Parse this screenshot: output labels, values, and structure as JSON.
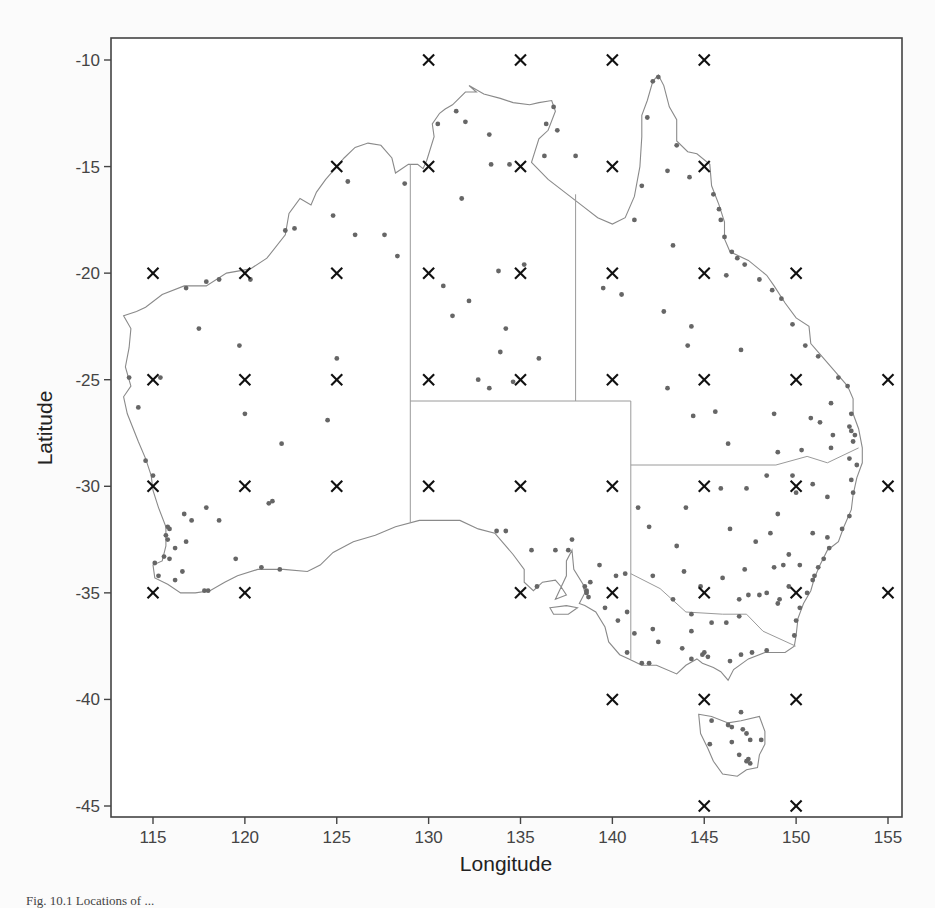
{
  "figure": {
    "caption": "Fig. 10.1 Locations of ..."
  },
  "chart_data": {
    "type": "scatter",
    "title": "",
    "xlabel": "Longitude",
    "ylabel": "Latitude",
    "xlim": [
      112.8,
      155.4
    ],
    "ylim": [
      -45.5,
      -9.0
    ],
    "xticks": [
      115,
      120,
      125,
      130,
      135,
      140,
      145,
      150,
      155
    ],
    "yticks": [
      -10,
      -15,
      -20,
      -25,
      -30,
      -35,
      -40,
      -45
    ],
    "grid": false,
    "legend": null,
    "series": [
      {
        "name": "Grid points",
        "marker": "x",
        "color": "#111111",
        "points": [
          [
            130,
            -10
          ],
          [
            135,
            -10
          ],
          [
            140,
            -10
          ],
          [
            145,
            -10
          ],
          [
            125,
            -15
          ],
          [
            130,
            -15
          ],
          [
            135,
            -15
          ],
          [
            140,
            -15
          ],
          [
            145,
            -15
          ],
          [
            115,
            -20
          ],
          [
            120,
            -20
          ],
          [
            125,
            -20
          ],
          [
            130,
            -20
          ],
          [
            135,
            -20
          ],
          [
            140,
            -20
          ],
          [
            145,
            -20
          ],
          [
            150,
            -20
          ],
          [
            115,
            -25
          ],
          [
            120,
            -25
          ],
          [
            125,
            -25
          ],
          [
            130,
            -25
          ],
          [
            135,
            -25
          ],
          [
            140,
            -25
          ],
          [
            145,
            -25
          ],
          [
            150,
            -25
          ],
          [
            155,
            -25
          ],
          [
            115,
            -30
          ],
          [
            120,
            -30
          ],
          [
            125,
            -30
          ],
          [
            130,
            -30
          ],
          [
            135,
            -30
          ],
          [
            140,
            -30
          ],
          [
            145,
            -30
          ],
          [
            150,
            -30
          ],
          [
            155,
            -30
          ],
          [
            115,
            -35
          ],
          [
            120,
            -35
          ],
          [
            135,
            -35
          ],
          [
            140,
            -35
          ],
          [
            145,
            -35
          ],
          [
            150,
            -35
          ],
          [
            155,
            -35
          ],
          [
            140,
            -40
          ],
          [
            145,
            -40
          ],
          [
            150,
            -40
          ],
          [
            145,
            -45
          ],
          [
            150,
            -45
          ]
        ]
      },
      {
        "name": "Stations",
        "marker": "dot",
        "color": "#666666",
        "points": [
          [
            132.0,
            -12.9
          ],
          [
            131.5,
            -12.4
          ],
          [
            133.3,
            -13.5
          ],
          [
            136.8,
            -12.2
          ],
          [
            136.4,
            -13.0
          ],
          [
            137.0,
            -13.3
          ],
          [
            141.9,
            -12.7
          ],
          [
            142.2,
            -11.0
          ],
          [
            142.5,
            -10.8
          ],
          [
            143.5,
            -14.0
          ],
          [
            143.0,
            -15.2
          ],
          [
            141.6,
            -15.9
          ],
          [
            141.2,
            -17.5
          ],
          [
            144.2,
            -15.5
          ],
          [
            145.5,
            -16.3
          ],
          [
            145.8,
            -17.0
          ],
          [
            145.9,
            -17.5
          ],
          [
            146.1,
            -18.3
          ],
          [
            146.5,
            -19.0
          ],
          [
            146.8,
            -19.3
          ],
          [
            147.2,
            -19.6
          ],
          [
            148.0,
            -20.3
          ],
          [
            148.7,
            -20.8
          ],
          [
            149.2,
            -21.2
          ],
          [
            149.8,
            -22.4
          ],
          [
            150.5,
            -23.4
          ],
          [
            151.2,
            -23.9
          ],
          [
            152.3,
            -24.9
          ],
          [
            152.8,
            -25.3
          ],
          [
            153.0,
            -26.6
          ],
          [
            153.0,
            -27.4
          ],
          [
            153.2,
            -27.6
          ],
          [
            152.9,
            -27.2
          ],
          [
            153.1,
            -27.9
          ],
          [
            152.9,
            -28.7
          ],
          [
            153.3,
            -29.0
          ],
          [
            153.0,
            -29.7
          ],
          [
            153.1,
            -30.3
          ],
          [
            152.9,
            -31.4
          ],
          [
            152.5,
            -32.0
          ],
          [
            151.8,
            -32.9
          ],
          [
            151.5,
            -33.4
          ],
          [
            151.2,
            -33.8
          ],
          [
            151.0,
            -34.2
          ],
          [
            150.9,
            -34.4
          ],
          [
            150.6,
            -35.0
          ],
          [
            150.2,
            -35.7
          ],
          [
            150.0,
            -36.3
          ],
          [
            149.9,
            -37.0
          ],
          [
            149.1,
            -35.3
          ],
          [
            149.0,
            -35.5
          ],
          [
            148.0,
            -35.1
          ],
          [
            147.4,
            -35.1
          ],
          [
            146.9,
            -36.1
          ],
          [
            145.0,
            -37.8
          ],
          [
            144.9,
            -37.9
          ],
          [
            145.2,
            -38.0
          ],
          [
            144.3,
            -38.1
          ],
          [
            143.8,
            -37.6
          ],
          [
            144.3,
            -36.8
          ],
          [
            145.4,
            -36.4
          ],
          [
            146.2,
            -36.4
          ],
          [
            146.4,
            -38.2
          ],
          [
            147.0,
            -37.9
          ],
          [
            147.6,
            -37.8
          ],
          [
            148.4,
            -37.7
          ],
          [
            142.0,
            -38.3
          ],
          [
            141.6,
            -38.3
          ],
          [
            142.5,
            -37.3
          ],
          [
            141.2,
            -36.9
          ],
          [
            142.2,
            -36.7
          ],
          [
            143.3,
            -35.3
          ],
          [
            142.2,
            -34.2
          ],
          [
            144.3,
            -36.0
          ],
          [
            140.8,
            -37.8
          ],
          [
            138.6,
            -34.9
          ],
          [
            138.6,
            -35.0
          ],
          [
            138.5,
            -34.7
          ],
          [
            138.7,
            -35.2
          ],
          [
            138.8,
            -34.5
          ],
          [
            137.6,
            -33.0
          ],
          [
            137.8,
            -32.5
          ],
          [
            136.9,
            -33.0
          ],
          [
            135.9,
            -34.7
          ],
          [
            135.6,
            -33.0
          ],
          [
            134.2,
            -32.1
          ],
          [
            133.7,
            -32.1
          ],
          [
            139.3,
            -33.7
          ],
          [
            140.2,
            -34.2
          ],
          [
            140.7,
            -34.1
          ],
          [
            139.6,
            -35.7
          ],
          [
            140.3,
            -36.3
          ],
          [
            140.8,
            -35.9
          ],
          [
            115.8,
            -31.9
          ],
          [
            115.9,
            -32.0
          ],
          [
            115.7,
            -32.3
          ],
          [
            115.8,
            -32.5
          ],
          [
            115.6,
            -33.3
          ],
          [
            115.1,
            -33.6
          ],
          [
            115.9,
            -33.4
          ],
          [
            116.2,
            -32.9
          ],
          [
            116.8,
            -32.6
          ],
          [
            117.1,
            -31.6
          ],
          [
            117.9,
            -31.0
          ],
          [
            117.8,
            -34.9
          ],
          [
            118.0,
            -34.9
          ],
          [
            116.6,
            -34.0
          ],
          [
            116.2,
            -34.4
          ],
          [
            115.3,
            -34.2
          ],
          [
            119.5,
            -33.4
          ],
          [
            120.9,
            -33.8
          ],
          [
            121.9,
            -33.9
          ],
          [
            121.3,
            -30.8
          ],
          [
            121.5,
            -30.7
          ],
          [
            118.6,
            -31.6
          ],
          [
            116.7,
            -31.3
          ],
          [
            115.0,
            -29.5
          ],
          [
            114.6,
            -28.8
          ],
          [
            114.2,
            -26.3
          ],
          [
            113.7,
            -24.9
          ],
          [
            115.4,
            -24.9
          ],
          [
            116.8,
            -20.7
          ],
          [
            117.9,
            -20.4
          ],
          [
            118.6,
            -20.3
          ],
          [
            120.3,
            -20.3
          ],
          [
            122.2,
            -18.0
          ],
          [
            122.7,
            -17.9
          ],
          [
            124.8,
            -17.3
          ],
          [
            125.6,
            -15.7
          ],
          [
            128.7,
            -15.8
          ],
          [
            126.0,
            -18.2
          ],
          [
            127.6,
            -18.2
          ],
          [
            119.7,
            -23.4
          ],
          [
            120.0,
            -26.6
          ],
          [
            124.5,
            -26.9
          ],
          [
            117.5,
            -22.6
          ],
          [
            122.0,
            -28.0
          ],
          [
            125.0,
            -24.0
          ],
          [
            128.3,
            -19.2
          ],
          [
            131.3,
            -22.0
          ],
          [
            133.9,
            -23.7
          ],
          [
            134.2,
            -22.6
          ],
          [
            135.2,
            -19.6
          ],
          [
            134.6,
            -25.1
          ],
          [
            133.8,
            -19.9
          ],
          [
            132.7,
            -25.0
          ],
          [
            133.3,
            -25.4
          ],
          [
            136.0,
            -24.0
          ],
          [
            132.2,
            -21.3
          ],
          [
            130.8,
            -20.6
          ],
          [
            131.8,
            -16.5
          ],
          [
            133.4,
            -14.9
          ],
          [
            134.4,
            -14.9
          ],
          [
            130.5,
            -13.0
          ],
          [
            136.3,
            -14.5
          ],
          [
            138.0,
            -14.5
          ],
          [
            139.5,
            -20.7
          ],
          [
            140.5,
            -21.0
          ],
          [
            143.3,
            -18.7
          ],
          [
            142.8,
            -21.8
          ],
          [
            144.3,
            -22.5
          ],
          [
            146.2,
            -20.1
          ],
          [
            147.0,
            -23.6
          ],
          [
            144.1,
            -23.4
          ],
          [
            145.6,
            -26.5
          ],
          [
            143.0,
            -25.4
          ],
          [
            148.8,
            -26.6
          ],
          [
            150.8,
            -26.8
          ],
          [
            151.9,
            -26.1
          ],
          [
            151.3,
            -27.0
          ],
          [
            152.0,
            -27.6
          ],
          [
            151.9,
            -28.2
          ],
          [
            150.3,
            -28.3
          ],
          [
            149.0,
            -28.4
          ],
          [
            146.3,
            -28.0
          ],
          [
            144.4,
            -26.7
          ],
          [
            148.4,
            -29.5
          ],
          [
            149.8,
            -29.5
          ],
          [
            150.9,
            -29.9
          ],
          [
            151.7,
            -30.5
          ],
          [
            150.0,
            -30.3
          ],
          [
            149.0,
            -31.3
          ],
          [
            147.3,
            -30.1
          ],
          [
            145.9,
            -30.1
          ],
          [
            144.0,
            -31.0
          ],
          [
            142.0,
            -31.9
          ],
          [
            141.4,
            -31.0
          ],
          [
            143.5,
            -32.8
          ],
          [
            146.4,
            -32.0
          ],
          [
            147.8,
            -32.6
          ],
          [
            148.6,
            -32.2
          ],
          [
            149.6,
            -33.2
          ],
          [
            150.2,
            -33.7
          ],
          [
            148.8,
            -33.8
          ],
          [
            147.2,
            -33.9
          ],
          [
            146.0,
            -34.3
          ],
          [
            144.8,
            -34.7
          ],
          [
            143.9,
            -34.0
          ],
          [
            146.9,
            -35.3
          ],
          [
            148.4,
            -35.0
          ],
          [
            149.3,
            -33.7
          ],
          [
            149.6,
            -34.7
          ],
          [
            151.7,
            -32.4
          ],
          [
            150.9,
            -32.2
          ],
          [
            145.4,
            -41.0
          ],
          [
            146.3,
            -41.2
          ],
          [
            146.5,
            -41.3
          ],
          [
            147.1,
            -41.4
          ],
          [
            147.3,
            -41.6
          ],
          [
            147.5,
            -41.9
          ],
          [
            147.3,
            -42.9
          ],
          [
            147.4,
            -42.8
          ],
          [
            147.5,
            -43.0
          ],
          [
            146.5,
            -42.0
          ],
          [
            145.3,
            -42.1
          ],
          [
            146.9,
            -42.6
          ],
          [
            148.1,
            -41.9
          ],
          [
            147.0,
            -40.6
          ]
        ]
      }
    ],
    "annotations": []
  },
  "map": {
    "region": "Australia",
    "coast_color": "#888888",
    "border_color": "#999999",
    "frame_color": "#444444"
  }
}
